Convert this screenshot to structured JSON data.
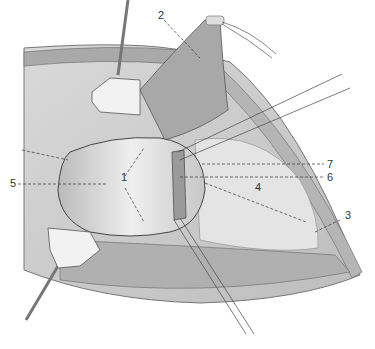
{
  "figure": {
    "type": "surgical anatomical illustration",
    "labels": [
      {
        "id": "1",
        "text": "1",
        "x": 121,
        "y": 178
      },
      {
        "id": "2",
        "text": "2",
        "x": 158,
        "y": 12
      },
      {
        "id": "3",
        "text": "3",
        "x": 345,
        "y": 214
      },
      {
        "id": "4",
        "text": "4",
        "x": 255,
        "y": 186
      },
      {
        "id": "5",
        "text": "5",
        "x": 10,
        "y": 179
      },
      {
        "id": "6",
        "text": "6",
        "x": 327,
        "y": 173
      },
      {
        "id": "7",
        "text": "7",
        "x": 327,
        "y": 160
      }
    ]
  }
}
